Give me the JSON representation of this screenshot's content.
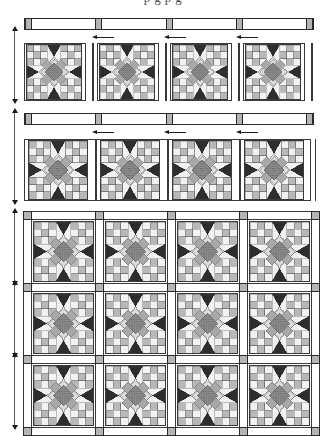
{
  "page": {
    "title_fragment": "p        g       p          g",
    "document_type": "quilt-assembly-diagram"
  },
  "colors": {
    "outline": "#3a3a3a",
    "strip_outline": "#2a2a2a",
    "cornerstone": "#b4b4b4",
    "background": "#ffffff",
    "light": "#f2f2f2",
    "medium_light": "#dcdcdc",
    "medium": "#b8b8b8",
    "medium_gray": "#a8a8a8",
    "dark": "#2e2e2e",
    "center_mottled": "#8a8a8a",
    "arrow": "#1b1b1b",
    "dimension_line": "#5a5a5a"
  },
  "sections": [
    {
      "id": "section-1",
      "name": "top-border-row",
      "sashing_strip": {
        "cornerstone_count": 5,
        "label": "top-sashing-strip"
      },
      "block_count": 4,
      "arrow_count": 3,
      "arrow_direction": "left"
    },
    {
      "id": "section-2",
      "name": "second-border-row",
      "sashing_strip": {
        "cornerstone_count": 5,
        "label": "second-sashing-strip"
      },
      "block_count": 4,
      "arrow_count": 3,
      "arrow_direction": "left"
    },
    {
      "id": "section-3",
      "name": "main-quilt-body",
      "rows": 3,
      "columns": 4,
      "block_count": 12
    }
  ],
  "block": {
    "name": "sawtooth-star-nine-patch",
    "grid": 9,
    "components": [
      "corner-nine-patch",
      "star-point-triangle",
      "on-point-square",
      "mottled-center"
    ]
  },
  "dimension_markers": {
    "count": 8,
    "style": "double-headed-vertical-arrow"
  },
  "legend": {
    "cornerstone_label": "cornerstone",
    "sashing_label": "sashing",
    "block_label": "block"
  }
}
